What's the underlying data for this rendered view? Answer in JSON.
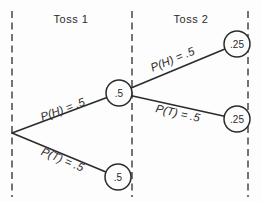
{
  "diagram": {
    "columns": [
      {
        "label": "Toss 1"
      },
      {
        "label": "Toss 2"
      }
    ],
    "branches": [
      {
        "id": "toss1-heads",
        "label": "P(H) = .5"
      },
      {
        "id": "toss1-tails",
        "label": "P(T) = .5"
      },
      {
        "id": "toss2-heads",
        "label": "P(H) = .5"
      },
      {
        "id": "toss2-tails",
        "label": "P(T) = .5"
      }
    ],
    "nodes": [
      {
        "id": "toss1-heads-node",
        "value": ".5"
      },
      {
        "id": "toss1-tails-node",
        "value": ".5"
      },
      {
        "id": "toss2-heads-node",
        "value": ".25"
      },
      {
        "id": "toss2-tails-node",
        "value": ".25"
      }
    ],
    "colors": {
      "line": "#2b2b2b",
      "boundary": "#3a3a3a",
      "background": "#fdfdfd",
      "node_fill": "#fdfdfd"
    }
  }
}
